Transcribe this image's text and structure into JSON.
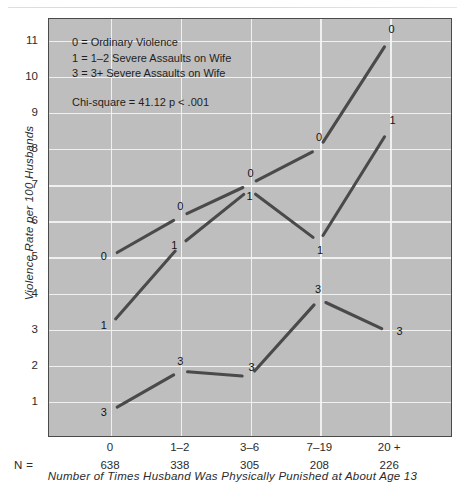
{
  "chart_data": {
    "type": "line",
    "title": "",
    "xlabel": "Number of Times Husband Was Physically Punished at About Age 13",
    "ylabel": "Violence Rate per 100 Husbands",
    "categories": [
      "0",
      "1–2",
      "3–6",
      "7–19",
      "20 +"
    ],
    "n_label": "N  =",
    "n_values": [
      "638",
      "338",
      "305",
      "208",
      "226"
    ],
    "ylim": [
      0,
      11.6
    ],
    "yticks": [
      1,
      2,
      3,
      4,
      5,
      6,
      7,
      8,
      9,
      10,
      11
    ],
    "grid": true,
    "legend_position": "inside-top-left",
    "series": [
      {
        "name": "0",
        "key": "ordinary-violence",
        "marker_label": "0",
        "values": [
          5.0,
          6.1,
          7.0,
          8.0,
          11.0
        ]
      },
      {
        "name": "1",
        "key": "severe-assaults-1-2",
        "marker_label": "1",
        "values": [
          3.1,
          5.3,
          6.85,
          5.4,
          8.5
        ]
      },
      {
        "name": "3",
        "key": "severe-assaults-3-plus",
        "marker_label": "3",
        "values": [
          0.7,
          1.8,
          1.65,
          3.8,
          2.9
        ]
      }
    ],
    "annotations": {
      "legend_lines": [
        "0  =  Ordinary Violence",
        "1  =  1–2 Severe Assaults on Wife",
        "3  =  3+ Severe Assaults on Wife"
      ],
      "stats_lines": [
        "Chi-square  =  41.12",
        "p < .001"
      ]
    },
    "colors": {
      "plot_background": "#bebebe",
      "gridline": "#f2f2f2",
      "line": "#4a4a4a",
      "frame": "#4a4a4a",
      "text": "#1e1e1e",
      "page_background": "#ffffff"
    }
  }
}
